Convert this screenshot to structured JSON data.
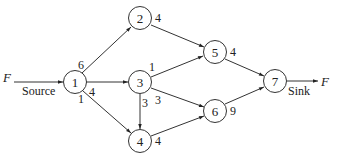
{
  "diagram": {
    "type": "flow-network",
    "source_label": "Source",
    "sink_label": "Sink",
    "flow_in_label": "F",
    "flow_out_label": "F",
    "nodes": [
      {
        "id": "1",
        "label": "1",
        "x": 75,
        "y": 82
      },
      {
        "id": "2",
        "label": "2",
        "x": 140,
        "y": 18
      },
      {
        "id": "3",
        "label": "3",
        "x": 140,
        "y": 82
      },
      {
        "id": "4",
        "label": "4",
        "x": 140,
        "y": 141
      },
      {
        "id": "5",
        "label": "5",
        "x": 215,
        "y": 52
      },
      {
        "id": "6",
        "label": "6",
        "x": 215,
        "y": 111
      },
      {
        "id": "7",
        "label": "7",
        "x": 275,
        "y": 81
      }
    ],
    "edges": [
      {
        "from": "1",
        "to": "2",
        "capacity": "6"
      },
      {
        "from": "1",
        "to": "3",
        "capacity": "4"
      },
      {
        "from": "1",
        "to": "4",
        "capacity": "1"
      },
      {
        "from": "2",
        "to": "5",
        "capacity": "4"
      },
      {
        "from": "3",
        "to": "5",
        "capacity": "1"
      },
      {
        "from": "3",
        "to": "4",
        "capacity": "3"
      },
      {
        "from": "3",
        "to": "6",
        "capacity": "3"
      },
      {
        "from": "4",
        "to": "6",
        "capacity": "4"
      },
      {
        "from": "5",
        "to": "7",
        "capacity": "4"
      },
      {
        "from": "6",
        "to": "7",
        "capacity": "9"
      }
    ]
  }
}
